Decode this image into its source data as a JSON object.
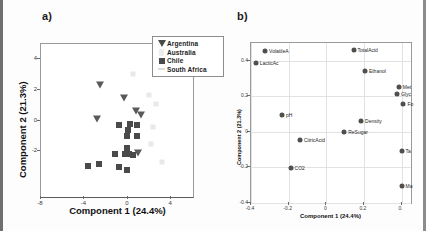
{
  "figure": {
    "panel_a_label": "a)",
    "panel_b_label": "b)"
  },
  "chart_data": [
    {
      "type": "scatter",
      "panel": "a)",
      "title": "",
      "xlabel": "Component 1 (24.4%)",
      "ylabel": "Component 2 (21.3%)",
      "xlim": [
        -8,
        6
      ],
      "ylim": [
        -5,
        5
      ],
      "xticks": [
        -8,
        -4,
        0,
        4
      ],
      "yticks": [
        4,
        2,
        0,
        -2
      ],
      "grid": false,
      "legend_position": "top-right",
      "series": [
        {
          "name": "Argentina",
          "marker": "triangle-down",
          "color": "#5a5a5a",
          "points": [
            {
              "x": -2.55,
              "y": 2.3
            },
            {
              "x": -0.4,
              "y": 1.5
            },
            {
              "x": 0.75,
              "y": 0.6
            },
            {
              "x": 1.2,
              "y": 0.35
            },
            {
              "x": -2.85,
              "y": 0.1
            },
            {
              "x": 0.95,
              "y": -2.1
            }
          ]
        },
        {
          "name": "Australia",
          "marker": "triangle-up-light",
          "color": "#ececec",
          "points": [
            {
              "x": 0.45,
              "y": 3.05
            },
            {
              "x": 1.95,
              "y": 1.65
            },
            {
              "x": 2.3,
              "y": -0.45
            }
          ]
        },
        {
          "name": "Chile",
          "marker": "square",
          "color": "#4a4a4a",
          "points": [
            {
              "x": -0.85,
              "y": -0.3
            },
            {
              "x": 0.2,
              "y": -0.2
            },
            {
              "x": 0.8,
              "y": -0.32
            },
            {
              "x": 0.05,
              "y": -0.65
            },
            {
              "x": -0.1,
              "y": -1.0
            },
            {
              "x": 0.85,
              "y": -1.0
            },
            {
              "x": -0.05,
              "y": -1.8
            },
            {
              "x": -1.2,
              "y": -2.2
            },
            {
              "x": -0.3,
              "y": -2.2
            },
            {
              "x": 0.1,
              "y": -2.2
            },
            {
              "x": 0.45,
              "y": -2.25
            },
            {
              "x": -3.7,
              "y": -2.95
            },
            {
              "x": -2.7,
              "y": -2.85
            },
            {
              "x": -0.85,
              "y": -3.05
            },
            {
              "x": -0.05,
              "y": -3.25
            }
          ]
        },
        {
          "name": "South Africa",
          "marker": "dot-light",
          "color": "#efefef",
          "points": [
            {
              "x": 2.6,
              "y": 1.05
            },
            {
              "x": 2.1,
              "y": -1.55
            },
            {
              "x": 3.1,
              "y": -2.7
            }
          ]
        }
      ],
      "legend": [
        {
          "label": "Argentina",
          "key": "triangle-down-icon"
        },
        {
          "label": "Australia",
          "key": "triangle-up-light-icon"
        },
        {
          "label": "Chile",
          "key": "square-icon"
        },
        {
          "label": "South Africa",
          "key": "dash-light-icon"
        }
      ]
    },
    {
      "type": "scatter",
      "panel": "b)",
      "title": "",
      "xlabel": "Component 1 (24.4%)",
      "ylabel": "Component 2 (21.3%)",
      "xlim": [
        -0.4,
        0.45
      ],
      "ylim": [
        -0.4,
        0.5
      ],
      "xticks": [
        -0.4,
        -0.2,
        0,
        0.2,
        0.4
      ],
      "yticks": [
        0.4,
        0.2,
        0,
        -0.2,
        -0.4
      ],
      "xticklabels": [
        "-0.4",
        "-0.2",
        "0",
        "0.2",
        "0."
      ],
      "yticklabels": [
        "0.4",
        "0.2",
        "0",
        "-0.2",
        "-0.4"
      ],
      "grid": true,
      "legend_position": "none",
      "loadings": [
        {
          "label": "VolatileA",
          "x": -0.325,
          "y": 0.455
        },
        {
          "label": "LacticAc",
          "x": -0.375,
          "y": 0.385
        },
        {
          "label": "TotalAcid",
          "x": 0.145,
          "y": 0.46
        },
        {
          "label": "Ethanol",
          "x": 0.205,
          "y": 0.34
        },
        {
          "label": "Met",
          "x": 0.385,
          "y": 0.255
        },
        {
          "label": "Glyc",
          "x": 0.375,
          "y": 0.215
        },
        {
          "label": "Fo",
          "x": 0.41,
          "y": 0.155
        },
        {
          "label": "pH",
          "x": -0.235,
          "y": 0.095
        },
        {
          "label": "Density",
          "x": 0.185,
          "y": 0.06
        },
        {
          "label": "ReSugar",
          "x": 0.095,
          "y": 0.0
        },
        {
          "label": "CitricAcid",
          "x": -0.14,
          "y": -0.045
        },
        {
          "label": "Ta",
          "x": 0.4,
          "y": -0.11
        },
        {
          "label": "CO2",
          "x": -0.19,
          "y": -0.205
        },
        {
          "label": "Ma",
          "x": 0.4,
          "y": -0.305
        }
      ]
    }
  ]
}
